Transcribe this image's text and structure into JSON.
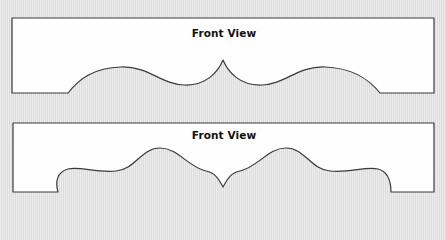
{
  "colors": {
    "background": "#e3e3e3",
    "panel_fill": "#fefefe",
    "outline": "#3a3a3a",
    "title_text": "#111111"
  },
  "panels": [
    {
      "title": "Front View",
      "style": "single-arch valance with center peak",
      "shape_path": "M12,18 L434,18 L434,93 L380,93 C368,78 352,68 325,67 C298,66 285,84 262,85 C240,86 228,72 223,60 C218,72 206,86 184,85 C161,84 148,66 121,67 C94,68 80,78 68,93 L12,93 Z"
    },
    {
      "title": "Front View",
      "style": "scalloped valance with stepped ends and center point",
      "shape_path": "M13,123 L434,123 L434,192 L391,192 C391,182 389,172 378,169 C366,166 350,173 330,171 C310,169 305,148 286,148 C268,148 258,167 240,171 C230,173 227,180 223,187 C219,180 216,173 206,171 C188,167 178,148 160,148 C141,148 136,169 116,171 C96,173 80,166 68,169 C57,172 55,182 58,192 L13,192 Z"
    }
  ]
}
